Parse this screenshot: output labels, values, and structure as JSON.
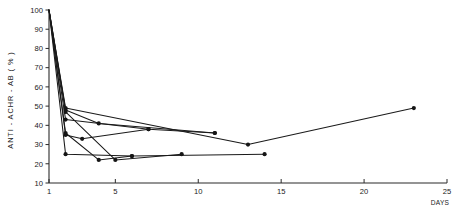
{
  "chart_data": {
    "type": "line",
    "title": "",
    "subtitle": "",
    "xlabel": "DAYS",
    "ylabel": "ANTI - ACHR - AB ( % )",
    "xlim": [
      1,
      25
    ],
    "ylim": [
      0,
      100
    ],
    "grid": false,
    "legend": "none",
    "x_ticks": [
      1,
      5,
      10,
      15,
      20,
      25
    ],
    "x_tick_labels": [
      "1",
      "5",
      "10",
      "15",
      "20",
      "25"
    ],
    "y_ticks": [
      10,
      20,
      30,
      40,
      50,
      60,
      70,
      80,
      90,
      100
    ],
    "y_tick_labels": [
      "10",
      "20",
      "30",
      "40",
      "50",
      "60",
      "70",
      "80",
      "90",
      "100"
    ],
    "marker": "filled-circle",
    "series": [
      {
        "name": "patient-1",
        "x": [
          1,
          2,
          13,
          23
        ],
        "values": [
          100,
          49,
          30,
          49
        ]
      },
      {
        "name": "patient-2",
        "x": [
          1,
          2,
          4,
          11
        ],
        "values": [
          100,
          48,
          41,
          36
        ]
      },
      {
        "name": "patient-3",
        "x": [
          1,
          2,
          7,
          11
        ],
        "values": [
          100,
          43,
          38,
          36
        ]
      },
      {
        "name": "patient-4",
        "x": [
          1,
          2,
          3,
          7
        ],
        "values": [
          100,
          35,
          33,
          38
        ]
      },
      {
        "name": "patient-5",
        "x": [
          1,
          2,
          4,
          6
        ],
        "values": [
          100,
          36,
          22,
          24
        ]
      },
      {
        "name": "patient-6",
        "x": [
          1,
          2,
          6,
          14
        ],
        "values": [
          100,
          25,
          24,
          25
        ]
      },
      {
        "name": "patient-7",
        "x": [
          1,
          2,
          5,
          9
        ],
        "values": [
          100,
          47,
          22,
          25
        ]
      }
    ]
  }
}
